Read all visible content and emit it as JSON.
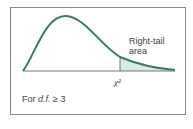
{
  "diagram": {
    "tail_label_line1": "Right-tail",
    "tail_label_line2": "area",
    "critical_value_label": "χ²",
    "df_prefix": "For ",
    "df_symbol": "d.f.",
    "df_condition": " ≥ 3",
    "colors": {
      "curve": "#3e7a5f",
      "tail_fill": "#d6ece5",
      "axis": "#555555",
      "frame": "#8a8a8a"
    }
  }
}
